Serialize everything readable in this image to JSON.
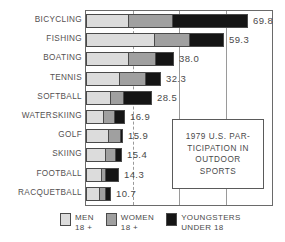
{
  "chart_data": {
    "type": "bar",
    "orientation": "horizontal",
    "stacked": true,
    "title_lines": [
      "1979 U.S. PAR-",
      "TICIPATION IN",
      "OUTDOOR",
      "SPORTS"
    ],
    "xlabel": "",
    "ylabel": "",
    "xlim": [
      0,
      80
    ],
    "gridlines": [
      20,
      40,
      60
    ],
    "grid": true,
    "legend_position": "bottom",
    "categories": [
      "BICYCLING",
      "FISHING",
      "BOATING",
      "TENNIS",
      "SOFTBALL",
      "WATERSKIING",
      "GOLF",
      "SKIING",
      "FOOTBALL",
      "RACQUETBALL"
    ],
    "totals": [
      69.8,
      59.3,
      38.0,
      32.3,
      28.5,
      16.9,
      15.9,
      15.4,
      14.3,
      10.7
    ],
    "value_labels": [
      "69.8",
      "59.3",
      "38.0",
      "32.3",
      "28.5",
      "16.9",
      "15.9",
      "15.4",
      "14.3",
      "10.7"
    ],
    "series": [
      {
        "name": "MEN 18 +",
        "key": "men",
        "color": "#dcdcdc",
        "values": [
          17.6,
          28.8,
          17.5,
          13.7,
          9.9,
          6.9,
          9.0,
          7.7,
          6.0,
          5.2
        ]
      },
      {
        "name": "WOMEN 18 +",
        "key": "women",
        "color": "#a0a0a0",
        "values": [
          18.9,
          15.0,
          11.6,
          11.2,
          5.6,
          4.7,
          5.2,
          4.3,
          1.6,
          2.6
        ]
      },
      {
        "name": "YOUNGSTERS UNDER 18",
        "key": "youth",
        "color": "#151515",
        "values": [
          33.3,
          15.5,
          8.9,
          7.4,
          13.0,
          5.3,
          1.7,
          3.4,
          6.7,
          2.9
        ]
      }
    ]
  },
  "legend": {
    "items": [
      {
        "label_line1": "MEN",
        "label_line2": "18 +",
        "key": "men"
      },
      {
        "label_line1": "WOMEN",
        "label_line2": "18 +",
        "key": "women"
      },
      {
        "label_line1": "YOUNGSTERS",
        "label_line2": "UNDER 18",
        "key": "youth"
      }
    ]
  },
  "colors": {
    "men": "#dcdcdc",
    "women": "#a0a0a0",
    "youth": "#151515",
    "frame": "#6a6a6a",
    "grid": "#9a9a9a",
    "text": "#4a4a4a",
    "background": "#ffffff"
  }
}
